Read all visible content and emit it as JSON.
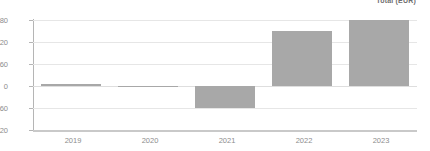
{
  "legend": {
    "text": "Total (EUR)"
  },
  "chart_data": {
    "type": "bar",
    "title": "",
    "subtitle": "",
    "xlabel": "",
    "ylabel": "",
    "categories": [
      "2019",
      "2020",
      "2021",
      "2022",
      "2023"
    ],
    "values": [
      5,
      0,
      -60,
      150,
      180
    ],
    "series": [
      {
        "name": "Total (EUR)",
        "values": [
          5,
          0,
          -60,
          150,
          180
        ],
        "color": "#a8a8a8"
      }
    ],
    "ylim": [
      -120,
      180
    ],
    "yticks": [
      180,
      120,
      60,
      0,
      -60,
      -120
    ],
    "ytick_labels": [
      "180",
      "120",
      "60",
      "0",
      "-60",
      "-120"
    ],
    "xtick_labels": [
      "2019",
      "2020",
      "2021",
      "2022",
      "2023"
    ],
    "grid": true,
    "grid_axis": "y",
    "legend_position": "top-right",
    "bar_color": "#a8a8a8",
    "gridline_color": "#e6e6e6",
    "axis_color": "#b5b5b5",
    "tick_label_color": "#8c8c8c",
    "background_color": "#ffffff"
  }
}
